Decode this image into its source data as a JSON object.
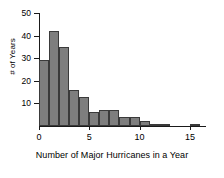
{
  "chart_data": {
    "type": "bar",
    "title": "",
    "subtitle": "",
    "xlabel": "Number of Major Hurricanes in a Year",
    "ylabel": "# of Years",
    "categories": [
      "0",
      "1",
      "2",
      "3",
      "4",
      "5",
      "6",
      "7",
      "8",
      "9",
      "10",
      "11",
      "12",
      "13",
      "14",
      "15"
    ],
    "bin_starts": [
      0,
      1,
      2,
      3,
      4,
      5,
      6,
      7,
      8,
      9,
      10,
      11,
      12,
      13,
      14,
      15
    ],
    "bin_width": 1,
    "values": [
      29,
      42,
      35,
      16,
      13,
      6,
      7,
      7,
      4,
      4,
      2,
      1,
      1,
      0,
      0,
      1
    ],
    "xlim": [
      0,
      16.5
    ],
    "ylim": [
      0,
      50
    ],
    "xticks": [
      0,
      5,
      10,
      15
    ],
    "xtick_labels": [
      "0",
      "5",
      "10",
      "15"
    ],
    "yticks": [
      10,
      20,
      30,
      40,
      50
    ],
    "ytick_labels": [
      "10",
      "20",
      "30",
      "40",
      "50"
    ],
    "grid": false,
    "legend": false,
    "legend_position": "none",
    "bar_fill_color": "#7e7e7e",
    "bar_edge_color": "#3a3a3a",
    "axis_color": "#1a1a1a",
    "background_color": "#ffffff"
  }
}
